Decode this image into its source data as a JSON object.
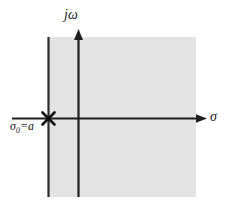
{
  "figure": {
    "type": "pole-zero-roc-plot",
    "background_color": "#ffffff",
    "shaded_region_color": "#e2e2e2",
    "line_color": "#1a1a1a",
    "axes": {
      "vertical": {
        "name": "imaginary-axis",
        "label": "jω",
        "position_x": 78,
        "top_y": 30,
        "bottom_y": 197
      },
      "horizontal": {
        "name": "real-axis",
        "label": "σ",
        "position_y": 118,
        "left_x": 12,
        "right_x": 206
      }
    },
    "roc": {
      "name": "region-of-convergence",
      "boundary_label": "σ₀ = a",
      "boundary_label_base": "σ",
      "boundary_label_subscript": "0",
      "boundary_label_equals": "=",
      "boundary_label_value": "a",
      "boundary_x": 48,
      "region_left": 48,
      "region_right": 196,
      "region_top": 37,
      "region_bottom": 197
    },
    "pole": {
      "name": "pole-marker",
      "symbol": "×",
      "x": 48,
      "y": 118
    }
  }
}
